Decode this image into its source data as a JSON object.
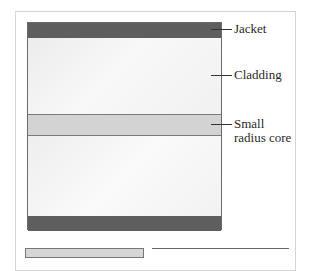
{
  "diagram": {
    "type": "optical-fiber-cross-section",
    "layers": [
      {
        "name": "jacket",
        "color": "#5e5e5e"
      },
      {
        "name": "cladding",
        "color": "#f4f4f4"
      },
      {
        "name": "core",
        "color": "#d3d3d3"
      },
      {
        "name": "cladding",
        "color": "#f4f4f4"
      },
      {
        "name": "jacket",
        "color": "#5e5e5e"
      }
    ],
    "labels": {
      "jacket": "Jacket",
      "cladding": "Cladding",
      "core_line1": "Small",
      "core_line2": "radius core"
    }
  }
}
